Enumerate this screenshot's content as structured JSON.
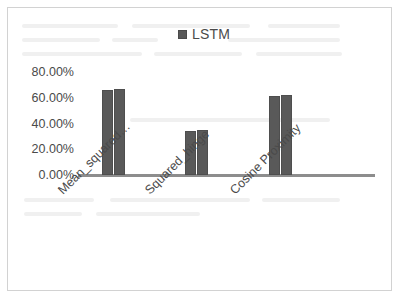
{
  "chart_data": {
    "type": "bar",
    "title": "",
    "subtitle": "",
    "xlabel": "",
    "ylabel": "",
    "categories": [
      "Mean_squared…",
      "Squared_hinge",
      "Cosine Proximity"
    ],
    "series": [
      {
        "name": "LSTM",
        "values": [
          66.0,
          34.5,
          61.0
        ]
      },
      {
        "name": "LSTM",
        "values": [
          67.0,
          35.0,
          62.5
        ]
      }
    ],
    "values": [
      66.0,
      34.5,
      61.0
    ],
    "ylim": [
      0,
      80
    ],
    "ytick_values": [
      80,
      60,
      40,
      20,
      0
    ],
    "ytick_labels": [
      "80.00%",
      "60.00%",
      "40.00%",
      "20.00%",
      "0.00%"
    ],
    "grid": false,
    "legend": {
      "position": "top-center",
      "entries": [
        "LSTM"
      ]
    },
    "bar_color": "#595959",
    "axis_color": "#8d8d8d",
    "frame_color": "#d2d2d2",
    "text_color": "#4a4a4a"
  },
  "legend": {
    "label": "LSTM",
    "swatch_name": "legend-swatch-lstm"
  },
  "yaxis": {
    "ticks": [
      {
        "label": "80.00%",
        "value": 80
      },
      {
        "label": "60.00%",
        "value": 60
      },
      {
        "label": "40.00%",
        "value": 40
      },
      {
        "label": "20.00%",
        "value": 20
      },
      {
        "label": "0.00%",
        "value": 0
      }
    ]
  },
  "xaxis": {
    "labels": [
      "Mean_squared…",
      "Squared_hinge",
      "Cosine Proximity"
    ]
  }
}
